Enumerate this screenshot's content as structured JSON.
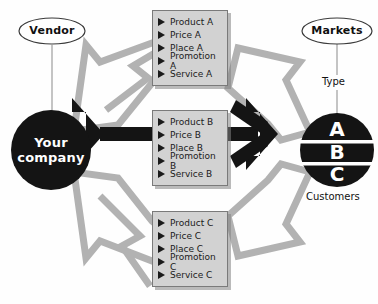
{
  "diagram": {
    "title_alt": "Vendor to Markets value chain diagram",
    "colors": {
      "background": "#fefefe",
      "dark": "#111111",
      "gray_arrow": "#b0b0b0",
      "box_fill": "#d2d2d2",
      "box_border": "#7a7a7a",
      "text": "#111111",
      "white": "#ffffff"
    },
    "nodes": {
      "vendor": {
        "label": "Vendor",
        "shape": "ellipse"
      },
      "company": {
        "line1": "Your",
        "line2": "company",
        "shape": "circle-filled"
      },
      "markets": {
        "label": "Markets",
        "shape": "ellipse"
      },
      "segments": {
        "shape": "circle-filled",
        "top_label": "Type",
        "bottom_label": "Customers",
        "letters": [
          "A",
          "B",
          "C"
        ]
      }
    },
    "boxes": [
      {
        "id": "box-a",
        "items": [
          "Product A",
          "Price A",
          "Place A",
          "Promotion A",
          "Service A"
        ]
      },
      {
        "id": "box-b",
        "items": [
          "Product B",
          "Price B",
          "Place B",
          "Promotion B",
          "Service B"
        ]
      },
      {
        "id": "box-c",
        "items": [
          "Product C",
          "Price C",
          "Place C",
          "Promotion C",
          "Service C"
        ]
      }
    ]
  }
}
